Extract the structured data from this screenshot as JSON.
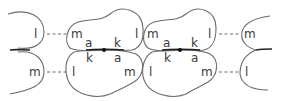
{
  "diagram": {
    "colors": {
      "outline": "#6b6b6b",
      "label": "#3a3a3a",
      "contact_dot": "#111111"
    },
    "left_partials": {
      "top": {
        "label": "l"
      },
      "bottom": {
        "label": "m"
      }
    },
    "blob_pairs": [
      {
        "top": {
          "left_label": "m",
          "right_label": "l",
          "contact_left": "a",
          "contact_right": "k"
        },
        "bottom": {
          "left_label": "l",
          "right_label": "m",
          "contact_left": "k",
          "contact_right": "a"
        }
      },
      {
        "top": {
          "left_label": "m",
          "right_label": "l",
          "contact_left": "a",
          "contact_right": "k"
        },
        "bottom": {
          "left_label": "l",
          "right_label": "m",
          "contact_left": "k",
          "contact_right": "a"
        }
      }
    ],
    "right_partials": {
      "top": {
        "label": "m"
      },
      "bottom": {
        "label": "l"
      }
    }
  }
}
